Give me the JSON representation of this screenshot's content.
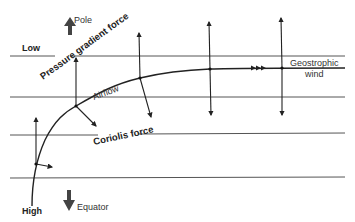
{
  "diagram": {
    "labels": {
      "low": "Low",
      "high": "High",
      "pole": "Pole",
      "equator": "Equator",
      "pressure_gradient_force": "Pressure gradient force",
      "coriolis_force": "Coriolis force",
      "airflow": "Airflow",
      "geostrophic_line1": "Geostrophic",
      "geostrophic_line2": "wind"
    },
    "isobars_y": [
      56,
      97,
      135,
      178
    ],
    "colors": {
      "line": "#222222",
      "isobar": "#555555",
      "direction_arrow": "#444444",
      "text": "#222222"
    },
    "airflow_points": [
      {
        "x": 36,
        "y": 164,
        "pgf_tip": [
          36,
          118
        ],
        "coriolis_tip": [
          52,
          167
        ]
      },
      {
        "x": 76,
        "y": 106,
        "pgf_tip": [
          76,
          58
        ],
        "coriolis_tip": [
          96,
          126
        ]
      },
      {
        "x": 140,
        "y": 78,
        "pgf_tip": [
          139,
          33
        ],
        "coriolis_tip": [
          151,
          117
        ]
      },
      {
        "x": 210,
        "y": 69,
        "pgf_tip": [
          209,
          22
        ],
        "coriolis_tip": [
          211,
          115
        ]
      },
      {
        "x": 282,
        "y": 68,
        "pgf_tip": [
          281,
          18
        ],
        "coriolis_tip": [
          282,
          115
        ]
      }
    ]
  }
}
